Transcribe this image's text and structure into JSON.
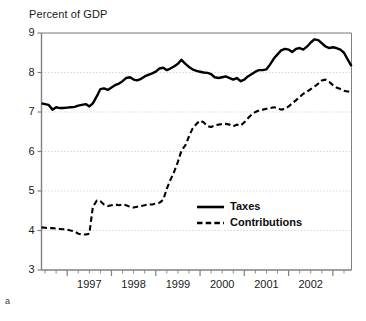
{
  "figure": {
    "title": "Percent of GDP",
    "panel_label": "a",
    "background_color": "#ffffff",
    "axis_color": "#808080",
    "grid_color": "#cccccc",
    "text_color": "#1a1a1a"
  },
  "legend": {
    "position": "center-right",
    "entries": [
      {
        "label": "Taxes",
        "style": "solid",
        "color": "#000000"
      },
      {
        "label": "Contributions",
        "style": "dashed",
        "color": "#000000"
      }
    ]
  },
  "chart_data": {
    "type": "line",
    "title": "Percent of GDP",
    "subtitle": "",
    "xlabel": "",
    "ylabel": "Percent of GDP",
    "xlim": [
      1996.42,
      2003.42
    ],
    "ylim": [
      3,
      9
    ],
    "yticks": [
      3,
      4,
      5,
      6,
      7,
      8,
      9
    ],
    "ytick_labels": [
      "3",
      "4",
      "5",
      "6",
      "7",
      "8",
      "9"
    ],
    "xticks": [
      1997,
      1998,
      1999,
      2000,
      2001,
      2002,
      2003
    ],
    "xtick_labels": [
      "1997",
      "1998",
      "1999",
      "2000",
      "2001",
      "2002",
      "2003"
    ],
    "minor_xticks_per_year": 4,
    "grid": "horizontal",
    "legend_position": "center-right",
    "series": [
      {
        "name": "Taxes",
        "style": "solid",
        "color": "#000000",
        "x": [
          1996.42,
          1996.5,
          1996.58,
          1996.67,
          1996.75,
          1996.83,
          1996.92,
          1997.0,
          1997.08,
          1997.17,
          1997.25,
          1997.33,
          1997.42,
          1997.5,
          1997.58,
          1997.67,
          1997.75,
          1997.83,
          1997.92,
          1998.0,
          1998.08,
          1998.17,
          1998.25,
          1998.33,
          1998.42,
          1998.5,
          1998.58,
          1998.67,
          1998.75,
          1998.83,
          1998.92,
          1999.0,
          1999.08,
          1999.17,
          1999.25,
          1999.33,
          1999.42,
          1999.5,
          1999.58,
          1999.67,
          1999.75,
          1999.83,
          1999.92,
          2000.0,
          2000.08,
          2000.17,
          2000.25,
          2000.33,
          2000.42,
          2000.5,
          2000.58,
          2000.67,
          2000.75,
          2000.83,
          2000.92,
          2001.0,
          2001.08,
          2001.17,
          2001.25,
          2001.33,
          2001.42,
          2001.5,
          2001.58,
          2001.67,
          2001.75,
          2001.83,
          2001.92,
          2002.0,
          2002.08,
          2002.17,
          2002.25,
          2002.33,
          2002.42,
          2002.5,
          2002.58,
          2002.67,
          2002.75,
          2002.83,
          2002.92,
          2003.0,
          2003.08,
          2003.17,
          2003.25,
          2003.33,
          2003.42
        ],
        "y": [
          7.22,
          7.2,
          7.18,
          7.06,
          7.12,
          7.1,
          7.1,
          7.11,
          7.12,
          7.13,
          7.16,
          7.18,
          7.2,
          7.14,
          7.22,
          7.4,
          7.58,
          7.6,
          7.56,
          7.62,
          7.68,
          7.72,
          7.78,
          7.86,
          7.88,
          7.82,
          7.8,
          7.84,
          7.9,
          7.94,
          7.98,
          8.02,
          8.1,
          8.12,
          8.06,
          8.1,
          8.16,
          8.22,
          8.32,
          8.22,
          8.14,
          8.08,
          8.04,
          8.02,
          8.0,
          7.99,
          7.96,
          7.88,
          7.86,
          7.88,
          7.9,
          7.86,
          7.82,
          7.86,
          7.78,
          7.82,
          7.9,
          7.96,
          8.02,
          8.06,
          8.06,
          8.08,
          8.2,
          8.36,
          8.46,
          8.56,
          8.6,
          8.58,
          8.52,
          8.6,
          8.62,
          8.58,
          8.66,
          8.76,
          8.84,
          8.82,
          8.74,
          8.66,
          8.62,
          8.64,
          8.62,
          8.58,
          8.5,
          8.34,
          8.16
        ]
      },
      {
        "name": "Contributions",
        "style": "dashed",
        "color": "#000000",
        "x": [
          1996.42,
          1996.5,
          1996.58,
          1996.67,
          1996.75,
          1996.83,
          1996.92,
          1997.0,
          1997.08,
          1997.17,
          1997.25,
          1997.33,
          1997.42,
          1997.5,
          1997.58,
          1997.67,
          1997.75,
          1997.83,
          1997.92,
          1998.0,
          1998.08,
          1998.17,
          1998.25,
          1998.33,
          1998.42,
          1998.5,
          1998.58,
          1998.67,
          1998.75,
          1998.83,
          1998.92,
          1999.0,
          1999.08,
          1999.17,
          1999.25,
          1999.33,
          1999.42,
          1999.5,
          1999.58,
          1999.67,
          1999.75,
          1999.83,
          1999.92,
          2000.0,
          2000.08,
          2000.17,
          2000.25,
          2000.33,
          2000.42,
          2000.5,
          2000.58,
          2000.67,
          2000.75,
          2000.83,
          2000.92,
          2001.0,
          2001.08,
          2001.17,
          2001.25,
          2001.33,
          2001.42,
          2001.5,
          2001.58,
          2001.67,
          2001.75,
          2001.83,
          2001.92,
          2002.0,
          2002.08,
          2002.17,
          2002.25,
          2002.33,
          2002.42,
          2002.5,
          2002.58,
          2002.67,
          2002.75,
          2002.83,
          2002.92,
          2003.0,
          2003.08,
          2003.17,
          2003.25,
          2003.33,
          2003.42
        ],
        "y": [
          4.08,
          4.07,
          4.06,
          4.06,
          4.05,
          4.04,
          4.03,
          4.02,
          4.0,
          3.98,
          3.92,
          3.9,
          3.9,
          3.92,
          4.6,
          4.76,
          4.74,
          4.66,
          4.62,
          4.64,
          4.66,
          4.64,
          4.66,
          4.64,
          4.6,
          4.58,
          4.6,
          4.62,
          4.64,
          4.66,
          4.66,
          4.68,
          4.7,
          4.78,
          5.06,
          5.28,
          5.5,
          5.74,
          6.02,
          6.16,
          6.38,
          6.58,
          6.7,
          6.78,
          6.74,
          6.64,
          6.62,
          6.66,
          6.68,
          6.7,
          6.7,
          6.68,
          6.64,
          6.68,
          6.66,
          6.74,
          6.84,
          6.94,
          7.0,
          7.04,
          7.06,
          7.08,
          7.1,
          7.12,
          7.1,
          7.06,
          7.08,
          7.14,
          7.22,
          7.3,
          7.38,
          7.46,
          7.52,
          7.58,
          7.64,
          7.72,
          7.8,
          7.82,
          7.76,
          7.68,
          7.62,
          7.58,
          7.54,
          7.52,
          7.52
        ]
      }
    ]
  }
}
